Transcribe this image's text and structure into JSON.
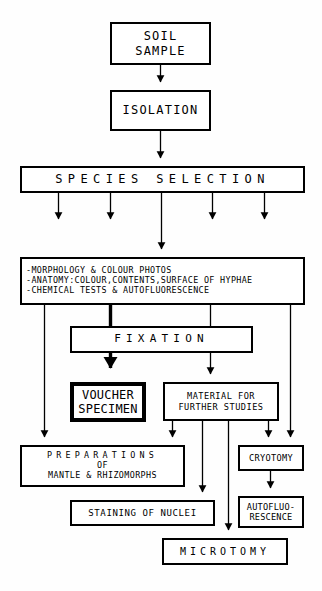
{
  "diagram": {
    "stroke_color": "#000000",
    "background_color": "#ffffff",
    "nodes": {
      "soil_sample": {
        "line1": "SOIL",
        "line2": "SAMPLE"
      },
      "isolation": {
        "line1": "ISOLATION"
      },
      "species_selection": {
        "line1": "SPECIES SELECTION"
      },
      "observations": {
        "line1": "-MORPHOLOGY & COLOUR PHOTOS",
        "line2": "-ANATOMY:COLOUR,CONTENTS,SURFACE OF HYPHAE",
        "line3": "-CHEMICAL TESTS & AUTOFLUORESCENCE"
      },
      "fixation": {
        "line1": "FIXATION"
      },
      "voucher_specimen": {
        "line1": "VOUCHER",
        "line2": "SPECIMEN"
      },
      "material_for_further_studies": {
        "line1": "MATERIAL FOR",
        "line2": "FURTHER STUDIES"
      },
      "preparations": {
        "line1": "PREPARATIONS",
        "line2": "OF",
        "line3": "MANTLE & RHIZOMORPHS"
      },
      "cryotomy": {
        "line1": "CRYOTOMY"
      },
      "staining_of_nuclei": {
        "line1": "STAINING OF NUCLEI"
      },
      "autofluorescence": {
        "line1": "AUTOFLUO-",
        "line2": "RESCENCE"
      },
      "microtomy": {
        "line1": "MICROTOMY"
      }
    }
  }
}
